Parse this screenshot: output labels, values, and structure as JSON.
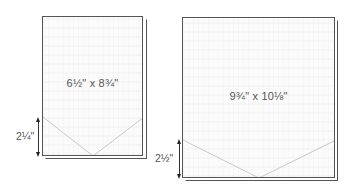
{
  "diagram": {
    "folders": [
      {
        "id": "small",
        "size_label": "6½\" x 8¾\"",
        "pocket_height_label": "2¼\""
      },
      {
        "id": "large",
        "size_label": "9¾\" x 10⅛\"",
        "pocket_height_label": "2½\""
      }
    ],
    "colors": {
      "card_fill": "#fbfbfb",
      "card_border": "#555555",
      "pocket_line": "#c8c8c8",
      "arrow": "#222222",
      "text": "#555555"
    }
  }
}
